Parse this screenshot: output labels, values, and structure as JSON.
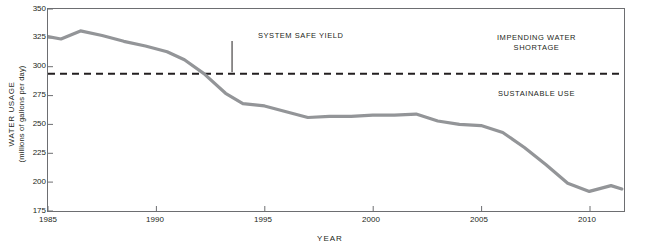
{
  "chart_data": {
    "type": "line",
    "title": "",
    "xlabel": "YEAR",
    "ylabel_line1": "WATER USAGE",
    "ylabel_line2": "(millions of gallons per day)",
    "xlim": [
      1985,
      2011.6
    ],
    "ylim": [
      175,
      350
    ],
    "x_ticks": [
      1985,
      1990,
      1995,
      2000,
      2005,
      2010
    ],
    "y_ticks": [
      175,
      200,
      225,
      250,
      275,
      300,
      325,
      350
    ],
    "grid": false,
    "legend": null,
    "series": [
      {
        "name": "Water usage",
        "color": "#939598",
        "x": [
          1985,
          1985.6,
          1986.5,
          1987.5,
          1988.5,
          1989.5,
          1990.5,
          1991.3,
          1992.2,
          1993.2,
          1994.0,
          1995.0,
          1996.0,
          1997.0,
          1998.0,
          1999.0,
          2000.0,
          2001.0,
          2002.0,
          2003.0,
          2004.0,
          2005.0,
          2006.0,
          2007.0,
          2008.0,
          2009.0,
          2010.0,
          2011.0,
          2011.5
        ],
        "values": [
          326,
          324,
          331,
          327,
          322,
          318,
          313,
          306,
          294,
          277,
          268,
          266,
          261,
          256,
          257,
          257,
          258,
          258,
          259,
          253,
          250,
          249,
          243,
          230,
          215,
          199,
          192,
          197,
          194
        ]
      }
    ],
    "reference_line": {
      "name": "System safe yield",
      "value": 294,
      "style": "dashed",
      "color": "#231f20"
    },
    "annotations": [
      {
        "name": "system-safe-yield",
        "text": "SYSTEM SAFE YIELD",
        "x": 1993.5,
        "y": 320
      },
      {
        "name": "impending-water-shortage-line1",
        "text": "IMPENDING WATER",
        "x": 2007.5,
        "y": 318
      },
      {
        "name": "impending-water-shortage-line2",
        "text": "SHORTAGE",
        "x": 2007.5,
        "y": 310
      },
      {
        "name": "sustainable-use",
        "text": "SUSTAINABLE USE",
        "x": 2007.5,
        "y": 265
      }
    ]
  },
  "labels": {
    "y_ticks": [
      "350",
      "325",
      "300",
      "275",
      "250",
      "225",
      "200",
      "175"
    ],
    "x_ticks": [
      "1985",
      "1990",
      "1995",
      "2000",
      "2005",
      "2010"
    ],
    "annotation_safe_yield": "SYSTEM SAFE YIELD",
    "annotation_impending_1": "IMPENDING WATER",
    "annotation_impending_2": "SHORTAGE",
    "annotation_sustainable": "SUSTAINABLE USE",
    "x_axis_title": "YEAR",
    "y_axis_title_1": "WATER USAGE",
    "y_axis_title_2": "(millions of gallons per day)"
  }
}
